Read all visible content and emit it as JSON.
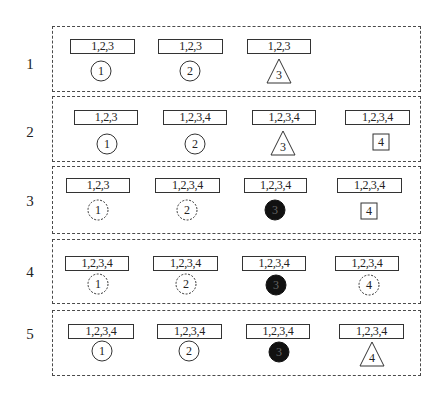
{
  "diagram": {
    "colors": {
      "stroke": "#333333",
      "fill_dark": "#111111",
      "panel_border": "#4a4a4a",
      "background": "#ffffff"
    },
    "rows": [
      {
        "label": "1",
        "panel": {
          "x": 52,
          "y": 26,
          "w": 369,
          "h": 66
        },
        "label_pos": {
          "x": 20,
          "y": 56
        },
        "nodes": [
          {
            "set": "1,2,3",
            "id": "1",
            "shape": "circle",
            "style": "solid",
            "box_x": 70,
            "box_y": 39,
            "box_w": 65,
            "cx": 101,
            "cy": 71
          },
          {
            "set": "1,2,3",
            "id": "2",
            "shape": "circle",
            "style": "solid",
            "box_x": 158,
            "box_y": 39,
            "box_w": 65,
            "cx": 190,
            "cy": 71
          },
          {
            "set": "1,2,3",
            "id": "3",
            "shape": "triangle",
            "style": "solid",
            "box_x": 247,
            "box_y": 39,
            "box_w": 64,
            "cx": 279,
            "cy": 71
          }
        ]
      },
      {
        "label": "2",
        "panel": {
          "x": 52,
          "y": 96,
          "w": 369,
          "h": 66
        },
        "label_pos": {
          "x": 20,
          "y": 124
        },
        "nodes": [
          {
            "set": "1,2,3",
            "id": "1",
            "shape": "circle",
            "style": "solid",
            "box_x": 74,
            "box_y": 110,
            "box_w": 64,
            "cx": 107,
            "cy": 144
          },
          {
            "set": "1,2,3,4",
            "id": "2",
            "shape": "circle",
            "style": "solid",
            "box_x": 163,
            "box_y": 110,
            "box_w": 64,
            "cx": 195,
            "cy": 144
          },
          {
            "set": "1,2,3,4",
            "id": "3",
            "shape": "triangle",
            "style": "solid",
            "box_x": 252,
            "box_y": 110,
            "box_w": 64,
            "cx": 283,
            "cy": 143
          },
          {
            "set": "1,2,3,4",
            "id": "4",
            "shape": "square",
            "style": "solid",
            "box_x": 345,
            "box_y": 110,
            "box_w": 65,
            "cx": 381,
            "cy": 142
          }
        ]
      },
      {
        "label": "3",
        "panel": {
          "x": 52,
          "y": 166,
          "w": 369,
          "h": 68
        },
        "label_pos": {
          "x": 20,
          "y": 193
        },
        "nodes": [
          {
            "set": "1,2,3",
            "id": "1",
            "shape": "circle",
            "style": "dashed",
            "box_x": 66,
            "box_y": 178,
            "box_w": 64,
            "cx": 98,
            "cy": 210
          },
          {
            "set": "1,2,3,4",
            "id": "2",
            "shape": "circle",
            "style": "dashed",
            "box_x": 155,
            "box_y": 178,
            "box_w": 65,
            "cx": 187,
            "cy": 210
          },
          {
            "set": "1,2,3,4",
            "id": "3",
            "shape": "filled-circle",
            "style": "filled",
            "box_x": 244,
            "box_y": 178,
            "box_w": 63,
            "cx": 275,
            "cy": 210
          },
          {
            "set": "1,2,3,4",
            "id": "4",
            "shape": "square",
            "style": "solid",
            "box_x": 337,
            "box_y": 178,
            "box_w": 65,
            "cx": 369,
            "cy": 211
          }
        ]
      },
      {
        "label": "4",
        "panel": {
          "x": 52,
          "y": 239,
          "w": 369,
          "h": 65
        },
        "label_pos": {
          "x": 20,
          "y": 264
        },
        "nodes": [
          {
            "set": "1,2,3,4",
            "id": "1",
            "shape": "circle",
            "style": "dashed",
            "box_x": 65,
            "box_y": 256,
            "box_w": 64,
            "cx": 98,
            "cy": 284
          },
          {
            "set": "1,2,3,4",
            "id": "2",
            "shape": "circle",
            "style": "dashed",
            "box_x": 153,
            "box_y": 256,
            "box_w": 65,
            "cx": 186,
            "cy": 284
          },
          {
            "set": "1,2,3,4",
            "id": "3",
            "shape": "filled-circle",
            "style": "filled",
            "box_x": 242,
            "box_y": 256,
            "box_w": 64,
            "cx": 276,
            "cy": 285
          },
          {
            "set": "1,2,3,4",
            "id": "4",
            "shape": "circle",
            "style": "dashed",
            "box_x": 335,
            "box_y": 256,
            "box_w": 64,
            "cx": 369,
            "cy": 285
          }
        ]
      },
      {
        "label": "5",
        "panel": {
          "x": 52,
          "y": 310,
          "w": 369,
          "h": 66
        },
        "label_pos": {
          "x": 20,
          "y": 326
        },
        "nodes": [
          {
            "set": "1,2,3,4",
            "id": "1",
            "shape": "circle",
            "style": "solid",
            "box_x": 68,
            "box_y": 324,
            "box_w": 66,
            "cx": 102,
            "cy": 351
          },
          {
            "set": "1,2,3,4",
            "id": "2",
            "shape": "circle",
            "style": "solid",
            "box_x": 157,
            "box_y": 324,
            "box_w": 65,
            "cx": 189,
            "cy": 351
          },
          {
            "set": "1,2,3,4",
            "id": "3",
            "shape": "filled-circle",
            "style": "filled",
            "box_x": 246,
            "box_y": 324,
            "box_w": 64,
            "cx": 279,
            "cy": 352
          },
          {
            "set": "1,2,3,4",
            "id": "4",
            "shape": "triangle",
            "style": "solid",
            "box_x": 339,
            "box_y": 324,
            "box_w": 65,
            "cx": 372,
            "cy": 354
          }
        ]
      }
    ]
  }
}
